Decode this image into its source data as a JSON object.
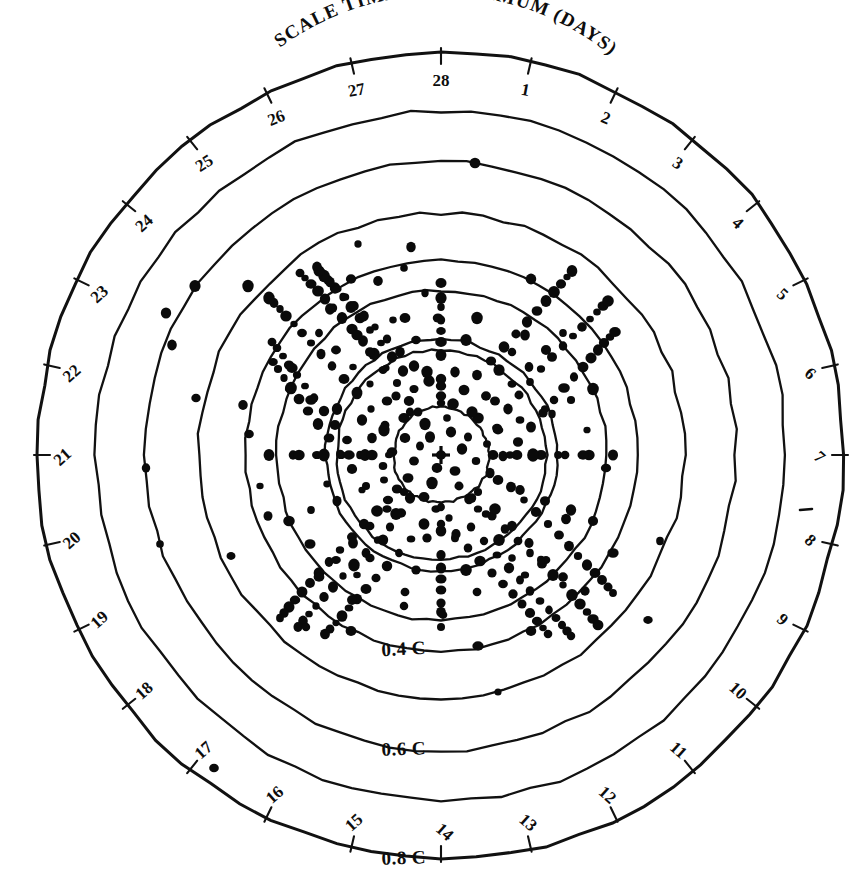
{
  "figure": {
    "kind": "polar-scatter-diagram",
    "title": "SCALE TIME OF MAXIMUM (DAYS)",
    "background_color": "#ffffff",
    "ink_color": "#111111",
    "center": {
      "x": 441,
      "y": 455
    },
    "center_marker": "plus-cross"
  },
  "angular_axis": {
    "label": "SCALE TIME OF MAXIMUM (DAYS)",
    "unit": "days",
    "period": 28,
    "zero_at": "top",
    "direction": "clockwise",
    "tick_labels": [
      "1",
      "2",
      "3",
      "4",
      "5",
      "6",
      "7",
      "8",
      "9",
      "10",
      "11",
      "12",
      "13",
      "14",
      "15",
      "16",
      "17",
      "18",
      "19",
      "20",
      "21",
      "22",
      "23",
      "24",
      "25",
      "26",
      "27",
      "28"
    ],
    "visible_tick_labels": [
      "1",
      "2",
      "3",
      "4",
      "5",
      "6",
      "7",
      "8",
      "9",
      "10",
      "11",
      "12",
      "13",
      "14",
      "15",
      "16",
      "17",
      "18",
      "19",
      "20",
      "21",
      "22",
      "23",
      "24",
      "25",
      "26",
      "27",
      "28"
    ]
  },
  "radial_axis": {
    "labels": [
      "0.4 C",
      "0.6 C",
      "0.8 C"
    ],
    "label_texts": {
      "inner": "0.4 C",
      "middle": "0.6 C",
      "outer": "0.8 C"
    },
    "unit": "C",
    "label_position": "bottom"
  },
  "chart_data": {
    "type": "scatter",
    "title": "SCALE TIME OF MAXIMUM (DAYS)",
    "xlabel": "SCALE TIME OF MAXIMUM (DAYS)",
    "ylabel": "C",
    "projection": "polar",
    "grid": true,
    "legend": "none",
    "theta_unit": "days",
    "theta_period": 28,
    "theta_ticks": [
      1,
      2,
      3,
      4,
      5,
      6,
      7,
      8,
      9,
      10,
      11,
      12,
      13,
      14,
      15,
      16,
      17,
      18,
      19,
      20,
      21,
      22,
      23,
      24,
      25,
      26,
      27,
      28
    ],
    "r_labeled_rings": [
      0.4,
      0.6,
      0.8
    ],
    "r_ring_radii_px": [
      48,
      105,
      116,
      165,
      196,
      243,
      295,
      345,
      403
    ],
    "rlim": [
      0,
      1.0
    ],
    "n_points": 372,
    "point_radius_px": 4.6,
    "note": "Hand-drawn concentric polar chart; points densely clustered toward centre.",
    "points": [
      [
        441,
        455
      ],
      [
        430,
        437
      ],
      [
        451,
        432
      ],
      [
        420,
        446
      ],
      [
        462,
        449
      ],
      [
        437,
        468
      ],
      [
        455,
        471
      ],
      [
        414,
        461
      ],
      [
        468,
        437
      ],
      [
        425,
        424
      ],
      [
        447,
        418
      ],
      [
        405,
        438
      ],
      [
        476,
        461
      ],
      [
        432,
        483
      ],
      [
        459,
        486
      ],
      [
        408,
        478
      ],
      [
        487,
        444
      ],
      [
        418,
        412
      ],
      [
        453,
        404
      ],
      [
        392,
        452
      ],
      [
        490,
        473
      ],
      [
        424,
        497
      ],
      [
        469,
        499
      ],
      [
        397,
        489
      ],
      [
        497,
        428
      ],
      [
        409,
        401
      ],
      [
        441,
        396
      ],
      [
        385,
        425
      ],
      [
        503,
        456
      ],
      [
        436,
        509
      ],
      [
        478,
        509
      ],
      [
        388,
        500
      ],
      [
        383,
        466
      ],
      [
        414,
        389
      ],
      [
        464,
        390
      ],
      [
        372,
        438
      ],
      [
        511,
        487
      ],
      [
        449,
        518
      ],
      [
        492,
        516
      ],
      [
        401,
        513
      ],
      [
        508,
        409
      ],
      [
        397,
        383
      ],
      [
        429,
        381
      ],
      [
        371,
        409
      ],
      [
        518,
        442
      ],
      [
        424,
        524
      ],
      [
        471,
        527
      ],
      [
        377,
        511
      ],
      [
        366,
        486
      ],
      [
        403,
        371
      ],
      [
        477,
        375
      ],
      [
        360,
        455
      ],
      [
        524,
        500
      ],
      [
        456,
        534
      ],
      [
        505,
        529
      ],
      [
        390,
        527
      ],
      [
        519,
        395
      ],
      [
        386,
        368
      ],
      [
        414,
        366
      ],
      [
        357,
        393
      ],
      [
        531,
        427
      ],
      [
        411,
        539
      ],
      [
        484,
        541
      ],
      [
        364,
        524
      ],
      [
        352,
        469
      ],
      [
        392,
        357
      ],
      [
        491,
        361
      ],
      [
        347,
        440
      ],
      [
        536,
        512
      ],
      [
        468,
        548
      ],
      [
        518,
        541
      ],
      [
        378,
        540
      ],
      [
        530,
        382
      ],
      [
        374,
        354
      ],
      [
        400,
        352
      ],
      [
        344,
        379
      ],
      [
        543,
        413
      ],
      [
        399,
        553
      ],
      [
        497,
        555
      ],
      [
        352,
        537
      ],
      [
        340,
        453
      ],
      [
        381,
        343
      ],
      [
        504,
        347
      ],
      [
        335,
        425
      ],
      [
        548,
        524
      ],
      [
        480,
        561
      ],
      [
        530,
        553
      ],
      [
        366,
        553
      ],
      [
        541,
        369
      ],
      [
        363,
        341
      ],
      [
        387,
        339
      ],
      [
        332,
        366
      ],
      [
        554,
        400
      ],
      [
        387,
        566
      ],
      [
        509,
        568
      ],
      [
        340,
        550
      ],
      [
        329,
        438
      ],
      [
        370,
        330
      ],
      [
        516,
        334
      ],
      [
        324,
        411
      ],
      [
        559,
        535
      ],
      [
        492,
        573
      ],
      [
        542,
        564
      ],
      [
        354,
        565
      ],
      [
        552,
        357
      ],
      [
        352,
        329
      ],
      [
        375,
        327
      ],
      [
        321,
        354
      ],
      [
        564,
        388
      ],
      [
        376,
        578
      ],
      [
        520,
        580
      ],
      [
        329,
        562
      ],
      [
        318,
        424
      ],
      [
        360,
        318
      ],
      [
        527,
        322
      ],
      [
        314,
        398
      ],
      [
        569,
        546
      ],
      [
        503,
        584
      ],
      [
        553,
        575
      ],
      [
        343,
        576
      ],
      [
        563,
        346
      ],
      [
        342,
        318
      ],
      [
        364,
        316
      ],
      [
        311,
        343
      ],
      [
        574,
        377
      ],
      [
        366,
        589
      ],
      [
        530,
        591
      ],
      [
        319,
        573
      ],
      [
        308,
        411
      ],
      [
        351,
        307
      ],
      [
        537,
        311
      ],
      [
        305,
        386
      ],
      [
        578,
        556
      ],
      [
        513,
        594
      ],
      [
        563,
        585
      ],
      [
        333,
        587
      ],
      [
        573,
        336
      ],
      [
        333,
        308
      ],
      [
        354,
        306
      ],
      [
        302,
        333
      ],
      [
        583,
        367
      ],
      [
        357,
        599
      ],
      [
        540,
        601
      ],
      [
        310,
        583
      ],
      [
        299,
        399
      ],
      [
        343,
        297
      ],
      [
        546,
        301
      ],
      [
        297,
        375
      ],
      [
        587,
        565
      ],
      [
        522,
        604
      ],
      [
        572,
        595
      ],
      [
        324,
        597
      ],
      [
        582,
        327
      ],
      [
        325,
        299
      ],
      [
        345,
        297
      ],
      [
        294,
        324
      ],
      [
        591,
        358
      ],
      [
        349,
        608
      ],
      [
        549,
        610
      ],
      [
        302,
        592
      ],
      [
        291,
        388
      ],
      [
        335,
        288
      ],
      [
        554,
        292
      ],
      [
        289,
        365
      ],
      [
        595,
        573
      ],
      [
        530,
        613
      ],
      [
        580,
        604
      ],
      [
        316,
        606
      ],
      [
        590,
        319
      ],
      [
        318,
        291
      ],
      [
        337,
        289
      ],
      [
        286,
        316
      ],
      [
        598,
        350
      ],
      [
        342,
        616
      ],
      [
        556,
        618
      ],
      [
        295,
        600
      ],
      [
        284,
        378
      ],
      [
        328,
        280
      ],
      [
        561,
        284
      ],
      [
        283,
        356
      ],
      [
        602,
        580
      ],
      [
        537,
        621
      ],
      [
        587,
        612
      ],
      [
        309,
        614
      ],
      [
        597,
        312
      ],
      [
        311,
        284
      ],
      [
        330,
        282
      ],
      [
        280,
        309
      ],
      [
        604,
        343
      ],
      [
        336,
        623
      ],
      [
        562,
        625
      ],
      [
        289,
        607
      ],
      [
        278,
        369
      ],
      [
        322,
        273
      ],
      [
        567,
        277
      ],
      [
        277,
        348
      ],
      [
        608,
        587
      ],
      [
        543,
        628
      ],
      [
        593,
        619
      ],
      [
        303,
        621
      ],
      [
        603,
        306
      ],
      [
        305,
        278
      ],
      [
        324,
        276
      ],
      [
        274,
        303
      ],
      [
        610,
        337
      ],
      [
        330,
        629
      ],
      [
        567,
        631
      ],
      [
        284,
        613
      ],
      [
        273,
        362
      ],
      [
        317,
        267
      ],
      [
        572,
        271
      ],
      [
        272,
        342
      ],
      [
        613,
        593
      ],
      [
        548,
        634
      ],
      [
        598,
        625
      ],
      [
        298,
        627
      ],
      [
        608,
        301
      ],
      [
        300,
        273
      ],
      [
        319,
        271
      ],
      [
        269,
        298
      ],
      [
        615,
        332
      ],
      [
        325,
        634
      ],
      [
        571,
        636
      ],
      [
        280,
        618
      ],
      [
        441,
        403
      ],
      [
        441,
        507
      ],
      [
        389,
        455
      ],
      [
        493,
        455
      ],
      [
        404,
        418
      ],
      [
        478,
        418
      ],
      [
        404,
        492
      ],
      [
        478,
        492
      ],
      [
        441,
        379
      ],
      [
        441,
        531
      ],
      [
        365,
        455
      ],
      [
        517,
        455
      ],
      [
        387,
        401
      ],
      [
        495,
        401
      ],
      [
        387,
        509
      ],
      [
        495,
        509
      ],
      [
        441,
        355
      ],
      [
        441,
        555
      ],
      [
        341,
        455
      ],
      [
        541,
        455
      ],
      [
        370,
        384
      ],
      [
        512,
        384
      ],
      [
        370,
        526
      ],
      [
        512,
        526
      ],
      [
        441,
        331
      ],
      [
        441,
        579
      ],
      [
        317,
        455
      ],
      [
        565,
        455
      ],
      [
        353,
        367
      ],
      [
        529,
        367
      ],
      [
        353,
        543
      ],
      [
        529,
        543
      ],
      [
        441,
        307
      ],
      [
        441,
        603
      ],
      [
        293,
        455
      ],
      [
        589,
        455
      ],
      [
        336,
        350
      ],
      [
        546,
        350
      ],
      [
        336,
        560
      ],
      [
        546,
        560
      ],
      [
        441,
        283
      ],
      [
        441,
        627
      ],
      [
        269,
        455
      ],
      [
        613,
        455
      ],
      [
        319,
        333
      ],
      [
        563,
        333
      ],
      [
        319,
        577
      ],
      [
        563,
        577
      ],
      [
        472,
        412
      ],
      [
        410,
        412
      ],
      [
        472,
        498
      ],
      [
        410,
        498
      ],
      [
        498,
        430
      ],
      [
        384,
        430
      ],
      [
        498,
        480
      ],
      [
        384,
        480
      ],
      [
        510,
        455
      ],
      [
        372,
        455
      ],
      [
        441,
        386
      ],
      [
        441,
        524
      ],
      [
        486,
        396
      ],
      [
        396,
        396
      ],
      [
        486,
        514
      ],
      [
        396,
        514
      ],
      [
        520,
        420
      ],
      [
        362,
        420
      ],
      [
        520,
        490
      ],
      [
        362,
        490
      ],
      [
        455,
        372
      ],
      [
        427,
        372
      ],
      [
        455,
        538
      ],
      [
        427,
        538
      ],
      [
        533,
        455
      ],
      [
        349,
        455
      ],
      [
        441,
        342
      ],
      [
        441,
        568
      ],
      [
        499,
        370
      ],
      [
        383,
        370
      ],
      [
        499,
        540
      ],
      [
        383,
        540
      ],
      [
        545,
        409
      ],
      [
        337,
        409
      ],
      [
        545,
        501
      ],
      [
        337,
        501
      ],
      [
        466,
        340
      ],
      [
        416,
        340
      ],
      [
        466,
        570
      ],
      [
        416,
        570
      ],
      [
        558,
        455
      ],
      [
        324,
        455
      ],
      [
        441,
        320
      ],
      [
        441,
        590
      ],
      [
        512,
        352
      ],
      [
        370,
        352
      ],
      [
        512,
        558
      ],
      [
        370,
        558
      ],
      [
        571,
        400
      ],
      [
        311,
        400
      ],
      [
        571,
        510
      ],
      [
        311,
        510
      ],
      [
        477,
        318
      ],
      [
        405,
        318
      ],
      [
        477,
        592
      ],
      [
        405,
        592
      ],
      [
        583,
        455
      ],
      [
        299,
        455
      ],
      [
        441,
        298
      ],
      [
        441,
        612
      ],
      [
        525,
        335
      ],
      [
        357,
        335
      ],
      [
        525,
        575
      ],
      [
        357,
        575
      ],
      [
        351,
        631
      ],
      [
        531,
        631
      ],
      [
        351,
        279
      ],
      [
        531,
        279
      ],
      [
        289,
        521
      ],
      [
        593,
        521
      ],
      [
        289,
        389
      ],
      [
        593,
        389
      ],
      [
        475,
        163
      ],
      [
        248,
        286
      ],
      [
        195,
        286
      ],
      [
        172,
        345
      ],
      [
        166,
        313
      ],
      [
        478,
        646
      ],
      [
        498,
        692
      ],
      [
        648,
        620
      ],
      [
        214,
        768
      ],
      [
        660,
        541
      ],
      [
        146,
        468
      ],
      [
        160,
        544
      ],
      [
        231,
        556
      ],
      [
        268,
        516
      ],
      [
        260,
        486
      ],
      [
        196,
        398
      ],
      [
        243,
        405
      ],
      [
        249,
        434
      ],
      [
        306,
        627
      ],
      [
        352,
        600
      ],
      [
        443,
        615
      ],
      [
        404,
        606
      ],
      [
        292,
        368
      ],
      [
        330,
        309
      ],
      [
        378,
        281
      ],
      [
        404,
        268
      ],
      [
        425,
        293
      ],
      [
        393,
        320
      ],
      [
        552,
        414
      ],
      [
        587,
        430
      ],
      [
        606,
        468
      ],
      [
        566,
        519
      ],
      [
        541,
        560
      ],
      [
        613,
        553
      ],
      [
        585,
        591
      ],
      [
        358,
        244
      ],
      [
        411,
        247
      ],
      [
        438,
        318
      ],
      [
        327,
        484
      ],
      [
        310,
        544
      ]
    ]
  }
}
